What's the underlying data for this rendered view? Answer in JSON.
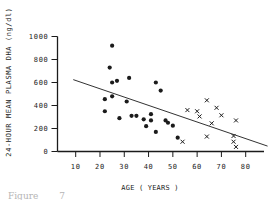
{
  "figure": {
    "caption": "Figure 7",
    "background": "#ffffff",
    "ink_color": "#1b1b1b"
  },
  "chart_data": {
    "type": "scatter",
    "title": "",
    "xlabel": "AGE ( YEARS )",
    "ylabel": "24-HOUR MEAN PLASMA DHA (ng/dl)",
    "xlim": [
      3,
      88
    ],
    "ylim": [
      0,
      1000
    ],
    "x_ticks": [
      10,
      20,
      30,
      40,
      50,
      60,
      70,
      80
    ],
    "y_ticks": [
      0,
      200,
      400,
      600,
      800,
      1000
    ],
    "grid": false,
    "legend": "none",
    "series": [
      {
        "name": "young-subjects-filled-circles",
        "marker": "circle",
        "points": [
          [
            25,
            920
          ],
          [
            24,
            730
          ],
          [
            32,
            640
          ],
          [
            27,
            615
          ],
          [
            25,
            600
          ],
          [
            43,
            600
          ],
          [
            45,
            530
          ],
          [
            25,
            480
          ],
          [
            22,
            455
          ],
          [
            31,
            435
          ],
          [
            22,
            350
          ],
          [
            28,
            290
          ],
          [
            33,
            310
          ],
          [
            35,
            310
          ],
          [
            41,
            325
          ],
          [
            38,
            280
          ],
          [
            41,
            270
          ],
          [
            39,
            220
          ],
          [
            43,
            170
          ],
          [
            47,
            270
          ],
          [
            48,
            250
          ],
          [
            50,
            225
          ],
          [
            52,
            120
          ]
        ]
      },
      {
        "name": "elderly-subjects-x-marks",
        "marker": "x",
        "points": [
          [
            54,
            85
          ],
          [
            56,
            360
          ],
          [
            60,
            350
          ],
          [
            61,
            305
          ],
          [
            64,
            445
          ],
          [
            64,
            130
          ],
          [
            66,
            245
          ],
          [
            68,
            380
          ],
          [
            70,
            315
          ],
          [
            75,
            135
          ],
          [
            75,
            85
          ],
          [
            76,
            270
          ],
          [
            76,
            40
          ]
        ]
      }
    ],
    "trend_line": {
      "x1": 9,
      "y1": 625,
      "x2": 89,
      "y2": 47
    }
  }
}
